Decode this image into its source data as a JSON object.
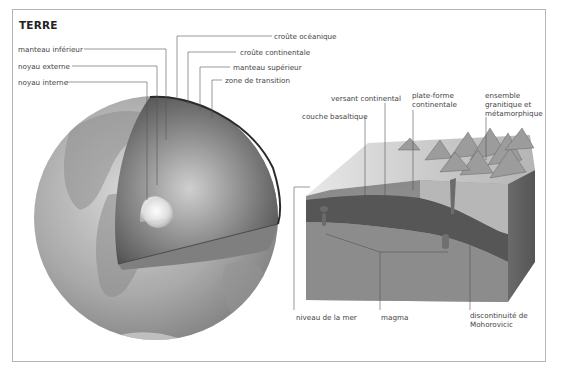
{
  "title": "TERRE",
  "globe": {
    "labels_left": [
      {
        "id": "manteau-inferieur",
        "text": "manteau inférieur"
      },
      {
        "id": "noyau-externe",
        "text": "noyau externe"
      },
      {
        "id": "noyau-interne",
        "text": "noyau interne"
      }
    ],
    "labels_right": [
      {
        "id": "croute-oceanique",
        "text": "croûte océanique"
      },
      {
        "id": "croute-continentale",
        "text": "croûte continentale"
      },
      {
        "id": "manteau-superieur",
        "text": "manteau supérieur"
      },
      {
        "id": "zone-de-transition",
        "text": "zone de transition"
      }
    ]
  },
  "block": {
    "labels_top": [
      {
        "id": "couche-basaltique",
        "text": "couche basaltique"
      },
      {
        "id": "versant-continental",
        "text": "versant continental"
      },
      {
        "id": "plate-forme-continentale",
        "text": "plate-forme continentale",
        "lines": [
          "plate-forme",
          "continentale"
        ]
      },
      {
        "id": "ensemble-granitique",
        "text": "ensemble granitique et métamorphique",
        "lines": [
          "ensemble",
          "granitique et",
          "métamorphique"
        ]
      }
    ],
    "labels_bottom": [
      {
        "id": "niveau-de-la-mer",
        "text": "niveau de la mer"
      },
      {
        "id": "magma",
        "text": "magma"
      },
      {
        "id": "discontinuite-mohorovicic",
        "text": "discontinuité de Mohorovicic",
        "lines": [
          "discontinuité de",
          "Mohorovicic"
        ]
      }
    ]
  },
  "colors": {
    "frame": "#b5b5b5",
    "leader_line": "#555555",
    "text": "#444444"
  }
}
